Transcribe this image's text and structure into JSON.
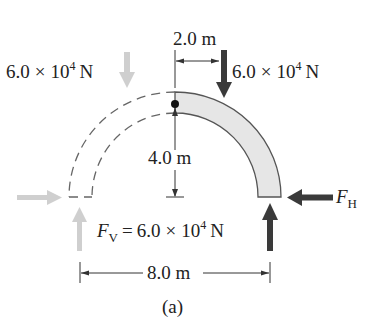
{
  "figure": {
    "caption": "(a)",
    "structure": "semicircular arch, right half shaded (free-body), left half dashed"
  },
  "loads": {
    "left_load": {
      "mantissa": "6.0",
      "times": "×",
      "base": "10",
      "exp": "4",
      "unit": "N",
      "color": "#c8c8c8"
    },
    "right_load": {
      "mantissa": "6.0",
      "times": "×",
      "base": "10",
      "exp": "4",
      "unit": "N",
      "color": "#333333"
    }
  },
  "dimensions": {
    "horizontal_offset": "2.0 m",
    "height": "4.0 m",
    "span": "8.0 m"
  },
  "reactions": {
    "horizontal": {
      "symbol": "F",
      "subscript": "H",
      "color": "#333333"
    },
    "vertical": {
      "symbol": "F",
      "subscript": "V",
      "equals": "=",
      "mantissa": "6.0",
      "times": "×",
      "base": "10",
      "exp": "4",
      "unit": "N",
      "color": "#333333"
    },
    "left_horizontal_color": "#c8c8c8",
    "left_vertical_color": "#c8c8c8"
  },
  "colors": {
    "arch_fill": "#e6e6e6",
    "arch_stroke": "#555555",
    "dashed": "#666666",
    "dim_line": "#333333"
  }
}
